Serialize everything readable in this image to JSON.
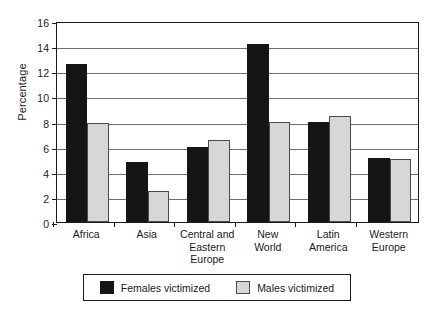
{
  "chart_data": {
    "type": "bar",
    "title": "",
    "subtitle": "",
    "xlabel": "",
    "ylabel": "Percentage",
    "categories": [
      "Africa",
      "Asia",
      "Central and Eastern Europe",
      "New World",
      "Latin America",
      "Western Europe"
    ],
    "category_lines": [
      [
        "Africa"
      ],
      [
        "Asia"
      ],
      [
        "Central and",
        "Eastern",
        "Europe"
      ],
      [
        "New",
        "World"
      ],
      [
        "Latin",
        "America"
      ],
      [
        "Western",
        "Europe"
      ]
    ],
    "series": [
      {
        "name": "Females victimized",
        "color": "#151515",
        "values": [
          12.6,
          4.8,
          6.0,
          14.2,
          8.0,
          5.1
        ]
      },
      {
        "name": "Males victimized",
        "color": "#d7d7d7",
        "values": [
          7.9,
          2.5,
          6.5,
          8.0,
          8.4,
          5.05
        ]
      }
    ],
    "ylim": [
      0,
      16
    ],
    "ytick_values": [
      0,
      2,
      4,
      6,
      8,
      10,
      12,
      14,
      16
    ],
    "ytick_labels": [
      "0",
      "2",
      "4",
      "6",
      "8",
      "10",
      "12",
      "14",
      "16"
    ],
    "grid": true,
    "grid_axis": "y",
    "legend_position": "bottom",
    "frame": true
  },
  "legend": {
    "entries": [
      {
        "label": "Females victimized",
        "swatch": "black-swatch"
      },
      {
        "label": "Males victimized",
        "swatch": "gray-swatch"
      }
    ]
  }
}
